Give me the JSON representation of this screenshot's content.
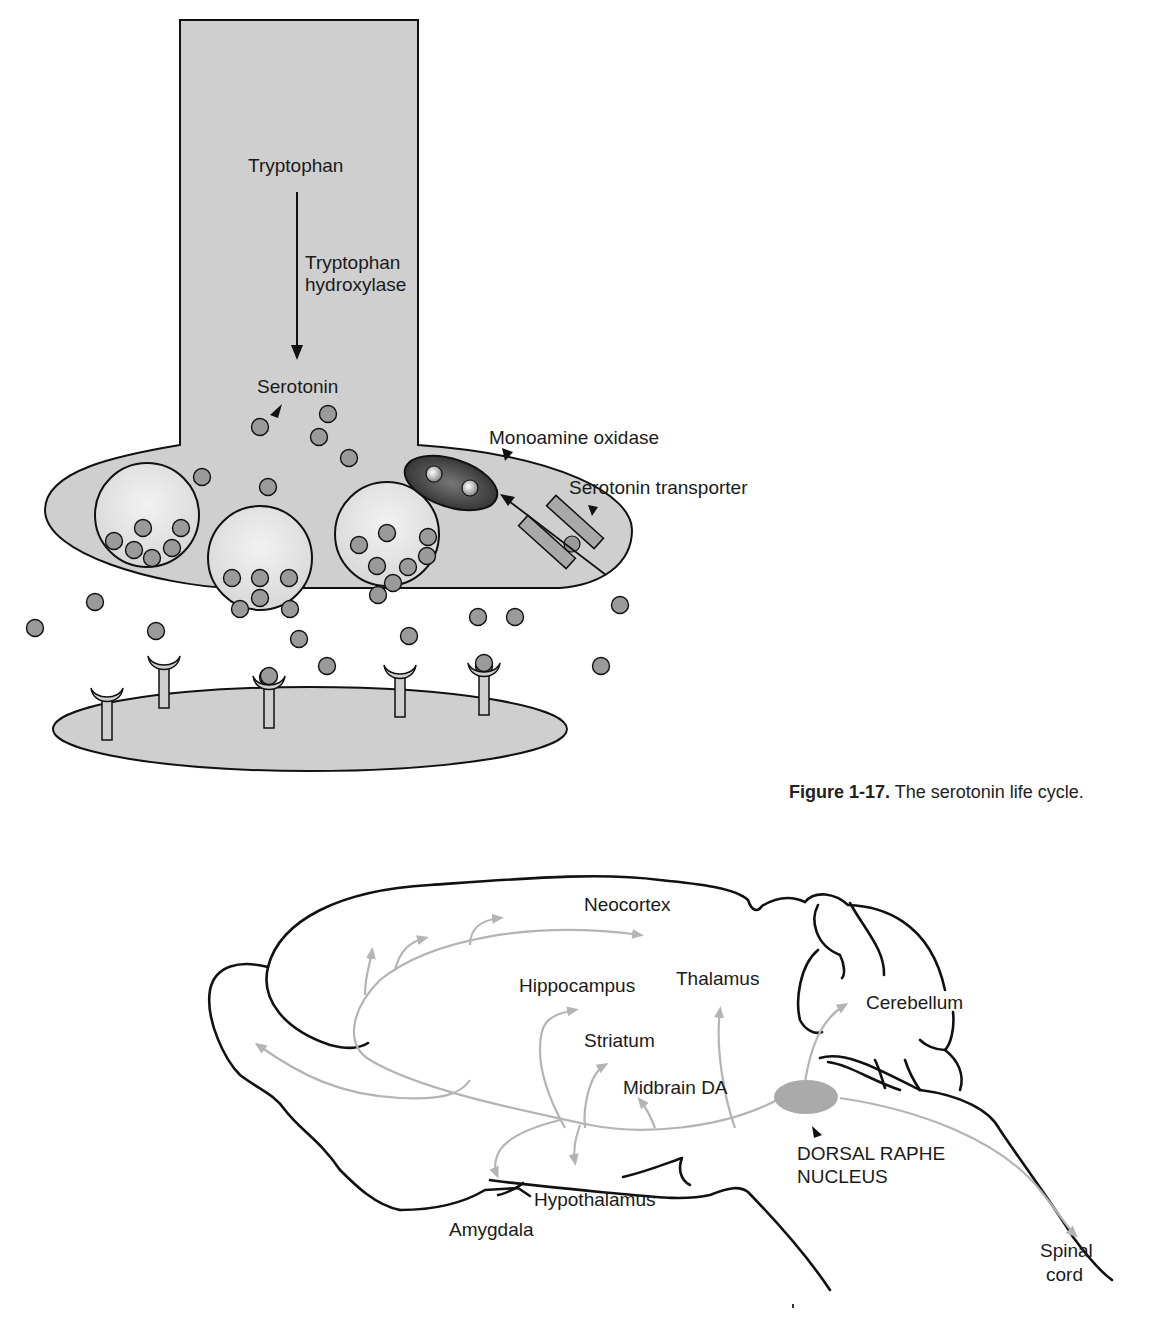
{
  "figure_top": {
    "caption_number": "Figure 1-17.",
    "caption_text": "The serotonin life cycle.",
    "labels": {
      "tryptophan": "Tryptophan",
      "enzyme_line1": "Tryptophan",
      "enzyme_line2": "hydroxylase",
      "serotonin": "Serotonin",
      "mao": "Monoamine oxidase",
      "transporter": "Serotonin transporter"
    },
    "colors": {
      "neuron_fill": "#cfcfcf",
      "vesicle_fill": "#e6e6e6",
      "molecule_fill": "#9a9a9a",
      "mao_fill": "#3a3a3a",
      "outline": "#111111"
    },
    "free_molecules": [
      [
        260,
        427
      ],
      [
        328,
        414
      ],
      [
        319,
        437
      ],
      [
        349,
        458
      ],
      [
        202,
        477
      ],
      [
        268,
        487
      ],
      [
        95,
        602
      ],
      [
        35,
        628
      ],
      [
        156,
        631
      ],
      [
        299,
        639
      ],
      [
        409,
        636
      ],
      [
        327,
        666
      ],
      [
        478,
        617
      ],
      [
        515,
        617
      ],
      [
        620,
        605
      ],
      [
        601,
        666
      ],
      [
        268,
        677
      ],
      [
        484,
        666
      ]
    ],
    "vesicles": [
      {
        "cx": 147,
        "cy": 515,
        "r": 52,
        "molecules": [
          [
            114,
            541
          ],
          [
            143,
            528
          ],
          [
            181,
            528
          ],
          [
            134,
            550
          ],
          [
            172,
            548
          ],
          [
            152,
            558
          ]
        ]
      },
      {
        "cx": 260,
        "cy": 558,
        "r": 52,
        "molecules": [
          [
            232,
            578
          ],
          [
            260,
            578
          ],
          [
            289,
            578
          ],
          [
            260,
            598
          ],
          [
            240,
            609
          ],
          [
            290,
            609
          ]
        ]
      },
      {
        "cx": 387,
        "cy": 534,
        "r": 52,
        "molecules": [
          [
            359,
            545
          ],
          [
            387,
            533
          ],
          [
            428,
            537
          ],
          [
            377,
            566
          ],
          [
            408,
            567
          ],
          [
            427,
            556
          ],
          [
            393,
            583
          ],
          [
            378,
            595
          ]
        ]
      }
    ],
    "receptors": [
      {
        "x": 107,
        "y": 700,
        "bound": false
      },
      {
        "x": 164,
        "y": 668,
        "bound": false
      },
      {
        "x": 269,
        "y": 688,
        "bound": true
      },
      {
        "x": 400,
        "y": 677,
        "bound": false
      },
      {
        "x": 484,
        "y": 675,
        "bound": true
      }
    ]
  },
  "figure_bottom": {
    "labels": {
      "neocortex": "Neocortex",
      "hippocampus": "Hippocampus",
      "thalamus": "Thalamus",
      "cerebellum": "Cerebellum",
      "striatum": "Striatum",
      "midbrain_da": "Midbrain DA",
      "raphe_line1": "DORSAL RAPHE",
      "raphe_line2": "NUCLEUS",
      "hypothalamus": "Hypothalamus",
      "amygdala": "Amygdala",
      "spinal_line1": "Spinal",
      "spinal_line2": "cord"
    },
    "colors": {
      "outline": "#111111",
      "pathway": "#b4b4b4",
      "nucleus_fill": "#aaaaaa"
    }
  }
}
